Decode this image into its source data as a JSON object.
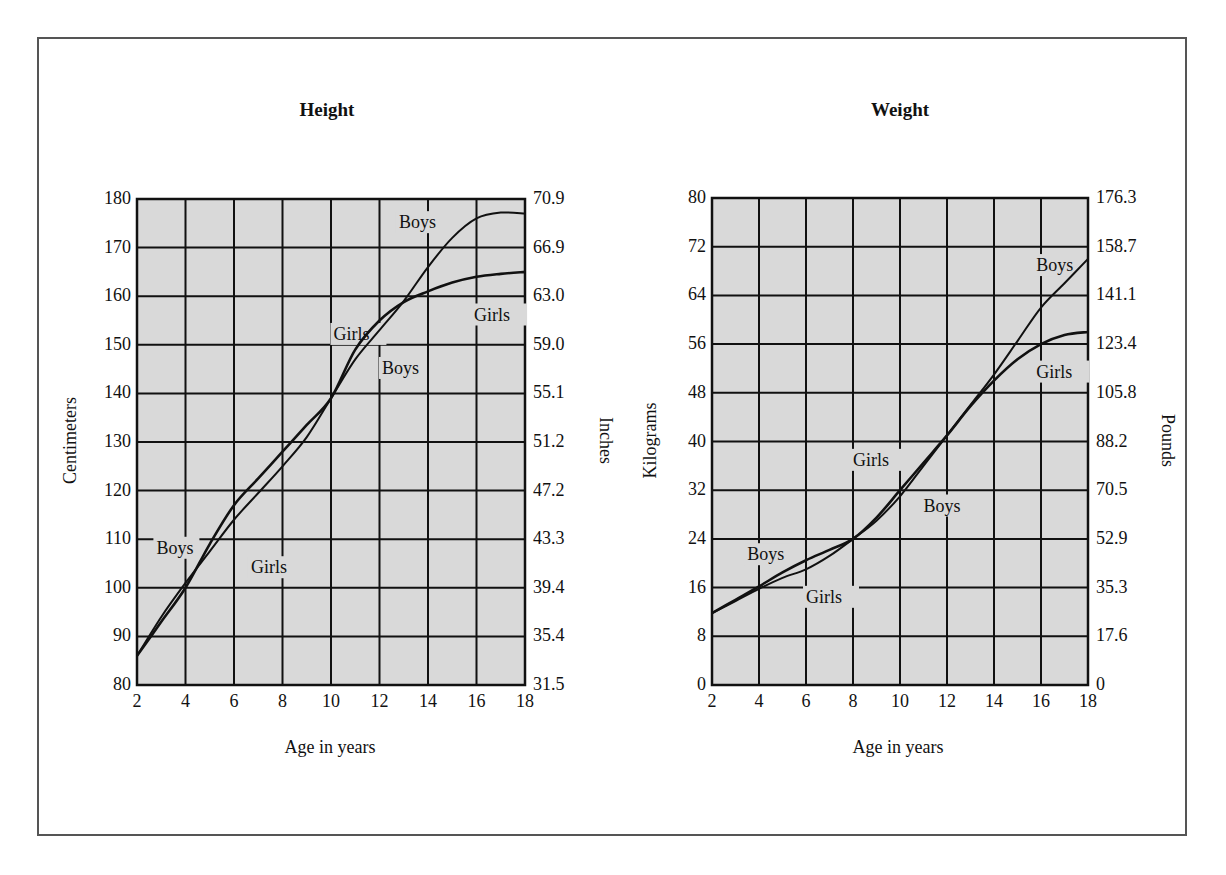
{
  "chart_data": [
    {
      "type": "line",
      "title": "Height",
      "xlabel": "Age in years",
      "ylabel": "Centimeters",
      "ylabel_right": "Inches",
      "xlim": [
        2,
        18
      ],
      "ylim": [
        80,
        180
      ],
      "x_ticks": [
        2,
        4,
        6,
        8,
        10,
        12,
        14,
        16,
        18
      ],
      "y_ticks_left": [
        80,
        90,
        100,
        110,
        120,
        130,
        140,
        150,
        160,
        170,
        180
      ],
      "y_ticks_right": [
        "31.5",
        "35.4",
        "39.4",
        "43.3",
        "47.2",
        "51.2",
        "55.1",
        "59.0",
        "63.0",
        "66.9",
        "70.9"
      ],
      "grid": true,
      "series": [
        {
          "name": "Boys",
          "x": [
            2,
            3,
            4,
            5,
            6,
            7,
            8,
            9,
            10,
            11,
            12,
            13,
            14,
            15,
            16,
            17,
            18
          ],
          "values": [
            86,
            94,
            101,
            107.5,
            114,
            119.5,
            125,
            131,
            139,
            147,
            153,
            159,
            166,
            172,
            176,
            177.2,
            177
          ]
        },
        {
          "name": "Girls",
          "x": [
            2,
            3,
            4,
            5,
            6,
            7,
            8,
            9,
            10,
            11,
            12,
            13,
            14,
            15,
            16,
            17,
            18
          ],
          "values": [
            86,
            93,
            100,
            109,
            117,
            122.5,
            128,
            133.5,
            139,
            149,
            155,
            158.8,
            161,
            162.8,
            164,
            164.6,
            165
          ]
        }
      ],
      "annotations": [
        {
          "text": "Boys",
          "x": 2.8,
          "y": 107
        },
        {
          "text": "Girls",
          "x": 6.7,
          "y": 103
        },
        {
          "text": "Girls",
          "x": 10.1,
          "y": 151
        },
        {
          "text": "Boys",
          "x": 12.1,
          "y": 144
        },
        {
          "text": "Boys",
          "x": 12.8,
          "y": 174
        },
        {
          "text": "Girls",
          "x": 15.9,
          "y": 155
        }
      ]
    },
    {
      "type": "line",
      "title": "Weight",
      "xlabel": "Age in years",
      "ylabel": "Kilograms",
      "ylabel_right": "Pounds",
      "xlim": [
        2,
        18
      ],
      "ylim": [
        0,
        80
      ],
      "x_ticks": [
        2,
        4,
        6,
        8,
        10,
        12,
        14,
        16,
        18
      ],
      "y_ticks_left": [
        0,
        8,
        16,
        24,
        32,
        40,
        48,
        56,
        64,
        72,
        80
      ],
      "y_ticks_right": [
        "0",
        "17.6",
        "35.3",
        "52.9",
        "70.5",
        "88.2",
        "105.8",
        "123.4",
        "141.1",
        "158.7",
        "176.3"
      ],
      "grid": true,
      "series": [
        {
          "name": "Boys",
          "x": [
            2,
            3,
            4,
            5,
            6,
            7,
            8,
            9,
            10,
            11,
            12,
            13,
            14,
            15,
            16,
            17,
            18
          ],
          "values": [
            11.8,
            13.8,
            15.8,
            17.6,
            19,
            21.2,
            24,
            27,
            31,
            36,
            41,
            46,
            51,
            56.5,
            62,
            66,
            70
          ]
        },
        {
          "name": "Girls",
          "x": [
            2,
            3,
            4,
            5,
            6,
            7,
            8,
            9,
            10,
            11,
            12,
            13,
            14,
            15,
            16,
            17,
            18
          ],
          "values": [
            11.8,
            14,
            16.2,
            18.5,
            20.5,
            22.2,
            24,
            27.5,
            32,
            36.5,
            41,
            45.8,
            50,
            53.5,
            56,
            57.5,
            58
          ]
        }
      ],
      "annotations": [
        {
          "text": "Boys",
          "x": 3.5,
          "y": 20.5
        },
        {
          "text": "Girls",
          "x": 6,
          "y": 13.5
        },
        {
          "text": "Girls",
          "x": 8,
          "y": 36
        },
        {
          "text": "Boys",
          "x": 11,
          "y": 28.5
        },
        {
          "text": "Boys",
          "x": 15.8,
          "y": 68
        },
        {
          "text": "Girls",
          "x": 15.8,
          "y": 50.5
        }
      ]
    }
  ],
  "height_chart": {
    "title": "Height",
    "xlabel": "Age in years",
    "ylabel_left": "Centimeters",
    "ylabel_right": "Inches"
  },
  "weight_chart": {
    "title": "Weight",
    "xlabel": "Age in years",
    "ylabel_left": "Kilograms",
    "ylabel_right": "Pounds"
  },
  "style": {
    "plot_background": "#d9d9d9",
    "grid_color": "#111111",
    "line_color": "#111111",
    "frame_color": "#555555"
  }
}
